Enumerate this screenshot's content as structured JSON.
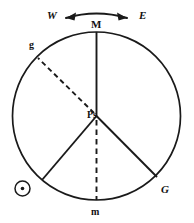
{
  "figure": {
    "type": "astronomical-circle-diagram",
    "background_color": "#ffffff",
    "stroke_color": "#1a1a1a",
    "circle": {
      "cx": 96.5,
      "cy": 116,
      "r": 84
    },
    "labels": {
      "west": "W",
      "east": "E",
      "meridian_top": "M",
      "g_lower": "g",
      "center": "Ps",
      "g_upper": "G",
      "m_lower": "m",
      "sun_symbol": "sun-symbol"
    },
    "arrow": {
      "name": "west-east-double-arrow",
      "description": "curved double-headed arrow above circle",
      "left_end": "W",
      "right_end": "E"
    },
    "radii": [
      {
        "name": "radius-to-M",
        "label": "M",
        "style": "solid",
        "angle_deg": 90,
        "endpoint": [
          96.5,
          32
        ]
      },
      {
        "name": "radius-to-g",
        "label": "g",
        "style": "dashed",
        "angle_deg": 135,
        "endpoint": [
          38,
          58
        ]
      },
      {
        "name": "radius-lower-left",
        "label": "",
        "style": "solid",
        "angle_deg": 220,
        "endpoint": [
          42,
          180
        ]
      },
      {
        "name": "radius-to-m",
        "label": "m",
        "style": "dashed",
        "angle_deg": 270,
        "endpoint": [
          96.5,
          200
        ]
      },
      {
        "name": "radius-to-G",
        "label": "G",
        "style": "solid",
        "angle_deg": 321,
        "endpoint": [
          157,
          177
        ]
      }
    ],
    "sun_marker": {
      "cx": 22.5,
      "cy": 188.5,
      "r_outer": 7.5,
      "r_inner": 1.8
    }
  }
}
